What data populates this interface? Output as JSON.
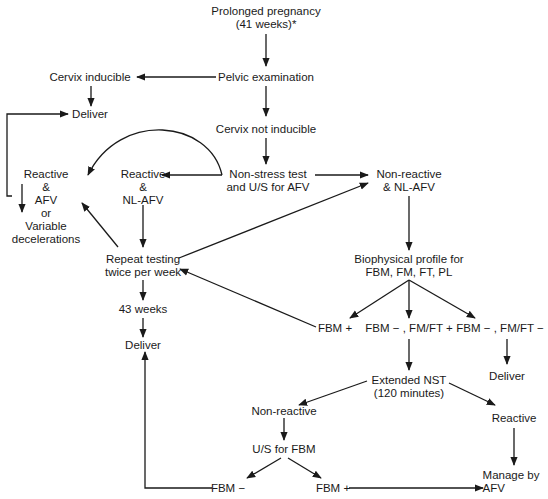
{
  "diagram": {
    "nodes": {
      "prolonged": {
        "lines": [
          "Prolonged pregnancy",
          "(41 weeks)*"
        ]
      },
      "pelvic": {
        "lines": [
          "Pelvic examination"
        ]
      },
      "cervix_inducible": {
        "lines": [
          "Cervix inducible"
        ]
      },
      "deliver_top": {
        "lines": [
          "Deliver"
        ]
      },
      "cervix_not_inducible": {
        "lines": [
          "Cervix not inducible"
        ]
      },
      "nst": {
        "lines": [
          "Non-stress test",
          "and U/S for AFV"
        ]
      },
      "reactive_afv": {
        "lines": [
          "Reactive",
          "&",
          "AFV",
          "or",
          "Variable",
          "decelerations"
        ]
      },
      "reactive_nlafv": {
        "lines": [
          "Reactive",
          "&",
          "NL-AFV"
        ]
      },
      "nonreactive_nlafv": {
        "lines": [
          "Non-reactive",
          "& NL-AFV"
        ]
      },
      "repeat_testing": {
        "lines": [
          "Repeat testing",
          "twice per week"
        ]
      },
      "weeks43": {
        "lines": [
          "43 weeks"
        ]
      },
      "deliver_mid": {
        "lines": [
          "Deliver"
        ]
      },
      "biophysical": {
        "lines": [
          "Biophysical profile for",
          "FBM, FM, FT, PL"
        ]
      },
      "fbm_plus": {
        "lines": [
          "FBM +"
        ]
      },
      "fbm_minus_fmft_plus": {
        "lines": [
          "FBM − , FM/FT +"
        ]
      },
      "fbm_minus_fmft_minus": {
        "lines": [
          "FBM − , FM/FT −"
        ]
      },
      "deliver_right": {
        "lines": [
          "Deliver"
        ]
      },
      "extended_nst": {
        "lines": [
          "Extended NST",
          "(120 minutes)"
        ]
      },
      "nonreactive": {
        "lines": [
          "Non-reactive"
        ]
      },
      "reactive": {
        "lines": [
          "Reactive"
        ]
      },
      "us_fbm": {
        "lines": [
          "U/S for FBM"
        ]
      },
      "fbm_minus_bottom": {
        "lines": [
          "FBM −"
        ]
      },
      "fbm_plus_bottom": {
        "lines": [
          "FBM +"
        ]
      },
      "manage_afv": {
        "lines": [
          "Manage by",
          "AFV"
        ]
      }
    },
    "edges": [
      {
        "from": "prolonged",
        "to": "pelvic"
      },
      {
        "from": "pelvic",
        "to": "cervix_inducible"
      },
      {
        "from": "pelvic",
        "to": "cervix_not_inducible"
      },
      {
        "from": "cervix_inducible",
        "to": "deliver_top"
      },
      {
        "from": "reactive_afv",
        "to": "deliver_top"
      },
      {
        "from": "cervix_not_inducible",
        "to": "nst"
      },
      {
        "from": "nst",
        "to": "reactive_nlafv"
      },
      {
        "from": "nst",
        "to": "reactive_afv"
      },
      {
        "from": "nst",
        "to": "nonreactive_nlafv"
      },
      {
        "from": "reactive_nlafv",
        "to": "repeat_testing"
      },
      {
        "from": "repeat_testing",
        "to": "reactive_afv"
      },
      {
        "from": "repeat_testing",
        "to": "nonreactive_nlafv"
      },
      {
        "from": "repeat_testing",
        "to": "weeks43"
      },
      {
        "from": "weeks43",
        "to": "deliver_mid"
      },
      {
        "from": "nonreactive_nlafv",
        "to": "biophysical"
      },
      {
        "from": "biophysical",
        "to": "fbm_plus"
      },
      {
        "from": "biophysical",
        "to": "fbm_minus_fmft_plus"
      },
      {
        "from": "biophysical",
        "to": "fbm_minus_fmft_minus"
      },
      {
        "from": "fbm_plus",
        "to": "repeat_testing"
      },
      {
        "from": "fbm_minus_fmft_minus",
        "to": "deliver_right"
      },
      {
        "from": "fbm_minus_fmft_plus",
        "to": "extended_nst"
      },
      {
        "from": "extended_nst",
        "to": "nonreactive"
      },
      {
        "from": "extended_nst",
        "to": "reactive"
      },
      {
        "from": "nonreactive",
        "to": "us_fbm"
      },
      {
        "from": "us_fbm",
        "to": "fbm_minus_bottom"
      },
      {
        "from": "us_fbm",
        "to": "fbm_plus_bottom"
      },
      {
        "from": "fbm_minus_bottom",
        "to": "deliver_mid"
      },
      {
        "from": "fbm_plus_bottom",
        "to": "manage_afv"
      },
      {
        "from": "reactive",
        "to": "manage_afv"
      }
    ],
    "stroke_color": "#1a1a1a",
    "background": "#ffffff"
  }
}
